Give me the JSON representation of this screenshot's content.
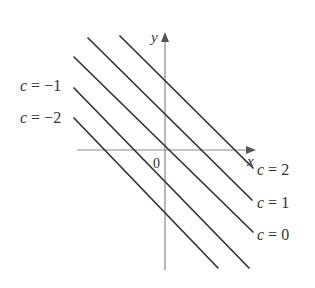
{
  "figure": {
    "axes": {
      "x_label": "x",
      "y_label": "y",
      "origin_label": "0"
    },
    "lines": [
      {
        "c": 2,
        "label": "c = 2",
        "x1": 120,
        "y1": 36,
        "x2": 253,
        "y2": 168
      },
      {
        "c": 1,
        "label": "c = 1",
        "x1": 88,
        "y1": 38,
        "x2": 252,
        "y2": 200
      },
      {
        "c": 0,
        "label": "c = 0",
        "x1": 74,
        "y1": 57,
        "x2": 253,
        "y2": 232
      },
      {
        "c": -1,
        "label": "c = −1",
        "x1": 74,
        "y1": 88,
        "x2": 249,
        "y2": 268
      },
      {
        "c": -2,
        "label": "c = −2",
        "x1": 74,
        "y1": 118,
        "x2": 218,
        "y2": 268
      }
    ],
    "labels": {
      "c2": "c = 2",
      "c1": "c = 1",
      "c0": "c = 0",
      "cm1": "c = −1",
      "cm2": "c = −2"
    },
    "colors": {
      "lines": "#333333",
      "axes": "#888888",
      "text": "#333333"
    }
  }
}
